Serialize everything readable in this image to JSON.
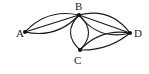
{
  "diagram": {
    "type": "multigraph",
    "colors": {
      "stroke": "#1a1a1a",
      "node": "#111111",
      "label": "#222222",
      "background": "#ffffff"
    },
    "nodes": [
      {
        "id": "A",
        "label": "A",
        "x": 25,
        "y": 32,
        "label_x": 16,
        "label_y": 37
      },
      {
        "id": "B",
        "label": "B",
        "x": 79,
        "y": 15,
        "label_x": 75,
        "label_y": 10
      },
      {
        "id": "C",
        "label": "C",
        "x": 80,
        "y": 50,
        "label_x": 74,
        "label_y": 64
      },
      {
        "id": "D",
        "label": "D",
        "x": 130,
        "y": 33,
        "label_x": 134,
        "label_y": 37
      }
    ],
    "edges": [
      {
        "from": "A",
        "to": "B",
        "curve": -8
      },
      {
        "from": "A",
        "to": "B",
        "curve": 0
      },
      {
        "from": "A",
        "to": "B",
        "curve": 8
      },
      {
        "from": "B",
        "to": "C",
        "curve": -9
      },
      {
        "from": "B",
        "to": "C",
        "curve": 9
      },
      {
        "from": "B",
        "to": "D",
        "curve": 9
      },
      {
        "from": "B",
        "to": "D",
        "curve": 0
      },
      {
        "from": "B",
        "to": "D",
        "curve": -9
      },
      {
        "from": "C",
        "to": "D",
        "curve": 5
      },
      {
        "from": "C",
        "to": "D",
        "curve": -7
      }
    ]
  }
}
